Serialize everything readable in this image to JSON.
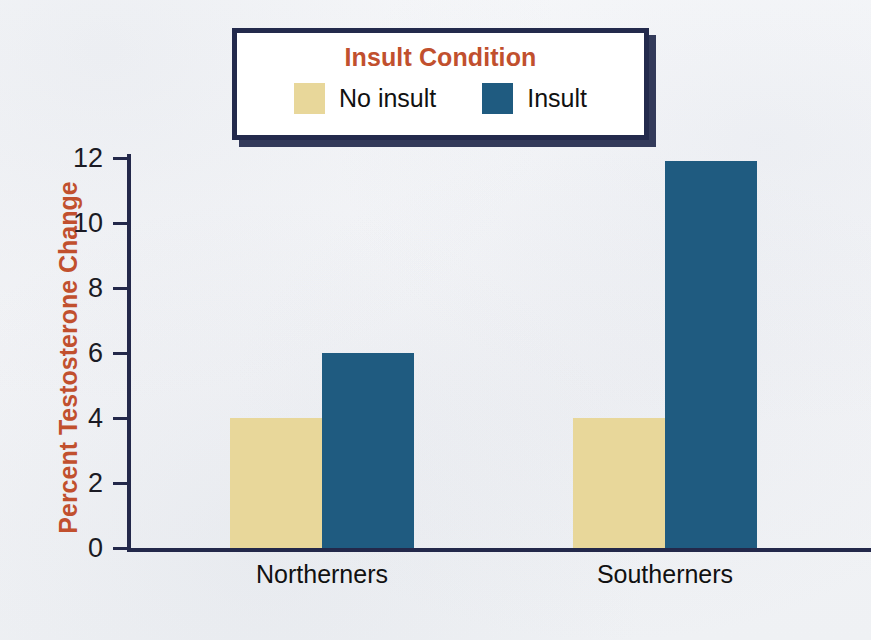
{
  "legend": {
    "title": "Insult Condition",
    "items": [
      {
        "label": "No insult",
        "color": "#e8d79a",
        "swatch_name": "legend-swatch-no-insult"
      },
      {
        "label": "Insult",
        "color": "#1f5b80",
        "swatch_name": "legend-swatch-insult"
      }
    ]
  },
  "axis": {
    "y_title": "Percent Testosterone Change",
    "y_ticks": [
      "0",
      "2",
      "4",
      "6",
      "8",
      "10",
      "12"
    ]
  },
  "categories": [
    "Northerners",
    "Southerners"
  ],
  "colors": {
    "accent_text": "#c1502e",
    "axis": "#23284a",
    "no_insult": "#e8d79a",
    "insult": "#1f5b80",
    "background": "#f4f5f7",
    "legend_border": "#232a4c"
  },
  "chart_data": {
    "type": "bar",
    "title": "Insult Condition",
    "subtitle": "",
    "xlabel": "",
    "ylabel": "Percent Testosterone Change",
    "categories": [
      "Northerners",
      "Southerners"
    ],
    "series": [
      {
        "name": "No insult",
        "color": "#e8d79a",
        "values": [
          4.0,
          4.0
        ]
      },
      {
        "name": "Insult",
        "color": "#1f5b80",
        "values": [
          6.0,
          11.9
        ]
      }
    ],
    "ylim": [
      0,
      12
    ],
    "ytick_values": [
      0,
      2,
      4,
      6,
      8,
      10,
      12
    ],
    "grid": false,
    "legend_position": "top-center",
    "annotations": []
  }
}
